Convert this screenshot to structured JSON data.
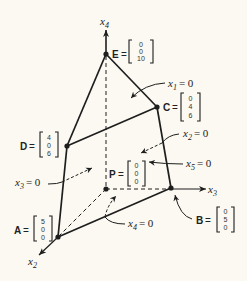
{
  "diagram": {
    "type": "polytope-3d",
    "axes": [
      {
        "id": "x4",
        "label": "x",
        "sub": "4",
        "direction": "up"
      },
      {
        "id": "x3",
        "label": "x",
        "sub": "3",
        "direction": "right"
      },
      {
        "id": "x2",
        "label": "x",
        "sub": "2",
        "direction": "down-left"
      }
    ],
    "points": {
      "E": {
        "label": "E",
        "eq": "=",
        "vector": [
          "0",
          "0",
          "10"
        ]
      },
      "C": {
        "label": "C",
        "eq": "=",
        "vector": [
          "0",
          "4",
          "6"
        ]
      },
      "D": {
        "label": "D",
        "eq": "=",
        "vector": [
          "4",
          "0",
          "6"
        ]
      },
      "P": {
        "label": "P",
        "eq": "=",
        "vector": [
          "0",
          "0",
          "0"
        ]
      },
      "A": {
        "label": "A",
        "eq": "=",
        "vector": [
          "5",
          "0",
          "0"
        ]
      },
      "B": {
        "label": "B",
        "eq": "=",
        "vector": [
          "0",
          "5",
          "0"
        ]
      }
    },
    "constraints": [
      {
        "id": "x1",
        "var": "x",
        "sub": "1",
        "rhs": "= 0"
      },
      {
        "id": "x2",
        "var": "x",
        "sub": "2",
        "rhs": "= 0"
      },
      {
        "id": "x3",
        "var": "x",
        "sub": "3",
        "rhs": "= 0"
      },
      {
        "id": "x4",
        "var": "x",
        "sub": "4",
        "rhs": "= 0"
      },
      {
        "id": "x5",
        "var": "x",
        "sub": "5",
        "rhs": "= 0"
      }
    ],
    "colors": {
      "background": "#fbf9f1",
      "ink": "#1e1e1e"
    }
  }
}
